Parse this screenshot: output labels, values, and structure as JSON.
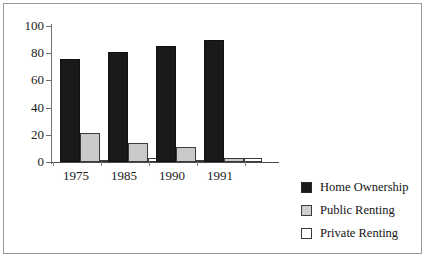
{
  "chart_data": {
    "type": "bar",
    "title": "",
    "subtitle": "",
    "xlabel": "",
    "ylabel": "",
    "categories": [
      "1975",
      "1985",
      "1990",
      "1991"
    ],
    "series": [
      {
        "name": "Home Ownership",
        "color": "#1a1a1a",
        "values": [
          76,
          81,
          85,
          90
        ]
      },
      {
        "name": "Public Renting",
        "color": "#c9c9c9",
        "values": [
          21,
          14,
          11,
          3
        ]
      },
      {
        "name": "Private Renting",
        "color": "#ffffff",
        "values": [
          1,
          3,
          1,
          3
        ]
      }
    ],
    "ylim": [
      0,
      100
    ],
    "yticks": [
      0,
      20,
      40,
      60,
      80,
      100
    ],
    "ytick_labels": [
      "0",
      "20",
      "40",
      "60",
      "80",
      "100"
    ],
    "grid": false,
    "legend_position": "right"
  },
  "legend": {
    "entries": [
      {
        "label": "Home Ownership"
      },
      {
        "label": "Public Renting"
      },
      {
        "label": "Private Renting"
      }
    ]
  }
}
